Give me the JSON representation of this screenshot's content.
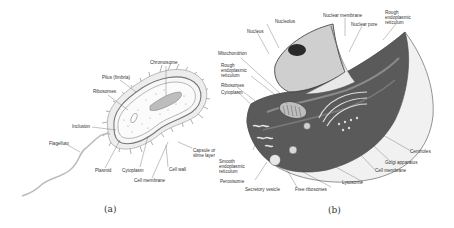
{
  "figure": {
    "panels": [
      {
        "id": "a",
        "caption": "(a)",
        "subject": "prokaryotic-cell",
        "labels": {
          "chromosome": "Chromosome",
          "pilus": "Pilus (fimbria)",
          "ribosomes": "Ribosomes",
          "inclusion": "Inclusion",
          "flagellum": "Flagellum",
          "plasmid": "Plasmid",
          "cytoplasm": "Cytoplasm",
          "cell_membrane": "Cell membrane",
          "cell_wall": "Cell wall",
          "capsule": "Capsule or\nslime layer"
        }
      },
      {
        "id": "b",
        "caption": "(b)",
        "subject": "eukaryotic-cell",
        "labels": {
          "nucleus": "Nucleus",
          "nucleolus": "Nucleolus",
          "nuclear_membrane": "Nuclear membrane",
          "nuclear_pore": "Nuclear pore",
          "rough_er_top": "Rough\nendoplasmic\nreticulum",
          "mitochondrion": "Mitochondrion",
          "rough_er_left": "Rough\nendoplasmic\nreticulum",
          "ribosomes": "Ribosomes",
          "cytoplasm": "Cytoplasm",
          "smooth_er": "Smooth\nendoplasmic\nreticulum",
          "peroxisome": "Peroxisome",
          "secretory_vesicle": "Secretory vesicle",
          "free_ribosomes": "Free ribosomes",
          "lysosome": "Lysosome",
          "cell_membrane": "Cell membrane",
          "golgi": "Golgi apparatus",
          "centrioles": "Centrioles"
        }
      }
    ]
  }
}
